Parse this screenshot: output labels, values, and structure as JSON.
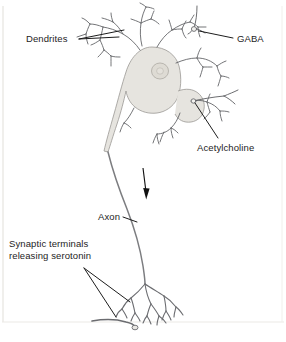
{
  "figure": {
    "type": "biological-diagram",
    "background_color": "#ffffff",
    "stroke_color": "#55565a",
    "label_color": "#1d1d1d",
    "soma_fill_color": "#e6e4df",
    "nucleus_fill_color": "#dedbd4",
    "border_color": "#e3e1dd"
  },
  "labels": {
    "dendrites": "Dendrites",
    "gaba": "GABA",
    "acetylcholine": "Acetylcholine",
    "axon": "Axon",
    "synaptic_terminals": "Synaptic terminals\nreleasing serotonin"
  },
  "parts": [
    {
      "id": "dendrites",
      "name": "Dendrites",
      "role": "input-branches",
      "location": "top"
    },
    {
      "id": "gaba-terminal",
      "name": "GABA",
      "role": "presynaptic-input-terminal",
      "location": "top-right"
    },
    {
      "id": "soma",
      "name": "Cell body",
      "role": "soma",
      "location": "center-top"
    },
    {
      "id": "nucleus",
      "name": "Nucleus",
      "role": "organelle",
      "location": "soma-center"
    },
    {
      "id": "acetylcholine-terminal",
      "name": "Acetylcholine",
      "role": "presynaptic-input-terminal",
      "location": "right"
    },
    {
      "id": "axon",
      "name": "Axon",
      "role": "conducting-fiber",
      "location": "center-descending"
    },
    {
      "id": "signal-arrow",
      "name": "Signal direction arrow",
      "role": "direction-indicator",
      "location": "upper-axon"
    },
    {
      "id": "synaptic-terminals",
      "name": "Synaptic terminals releasing serotonin",
      "role": "output-terminals",
      "location": "bottom"
    },
    {
      "id": "target-cell",
      "name": "Target cell",
      "role": "postsynaptic-target",
      "location": "bottom-left"
    }
  ]
}
